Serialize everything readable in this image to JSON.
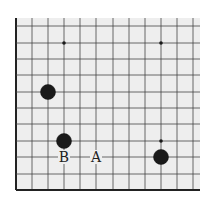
{
  "board": {
    "background": "#eeeeee",
    "line_color": "#444444",
    "edge_color": "#222222",
    "stone_color": "#1a1a1a",
    "x_lines": [
      16,
      32,
      48,
      64,
      80,
      96,
      113,
      129,
      145,
      161,
      177,
      193
    ],
    "y_lines": [
      26,
      43,
      59,
      75,
      92,
      108,
      124,
      141,
      157,
      174,
      190
    ],
    "top_edge": 18,
    "right_edge": 200,
    "left_edge_x": 16,
    "bottom_edge_y": 190,
    "star_points": [
      {
        "x": 64,
        "y": 43
      },
      {
        "x": 161,
        "y": 43
      },
      {
        "x": 161,
        "y": 141
      }
    ],
    "stones": [
      {
        "x": 48,
        "y": 92,
        "color": "black"
      },
      {
        "x": 64,
        "y": 141,
        "color": "black"
      },
      {
        "x": 161,
        "y": 157,
        "color": "black"
      }
    ],
    "labels": [
      {
        "text": "B",
        "x": 64,
        "y": 157
      },
      {
        "text": "A",
        "x": 96,
        "y": 157
      }
    ]
  }
}
